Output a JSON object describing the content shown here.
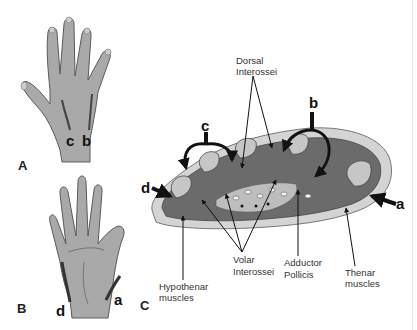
{
  "figure": {
    "panels": [
      {
        "id": "A",
        "label": "A",
        "description": "Dorsal hand with incision sites",
        "site_labels": [
          "c",
          "b"
        ]
      },
      {
        "id": "B",
        "label": "B",
        "description": "Volar hand with incision sites",
        "site_labels": [
          "d",
          "a"
        ]
      },
      {
        "id": "C",
        "label": "C",
        "description": "Cross-section of hand compartments",
        "site_labels": [
          "c",
          "b",
          "d",
          "a"
        ]
      }
    ],
    "panel_a": {
      "letter": "A",
      "site_c": "c",
      "site_b": "b"
    },
    "panel_b": {
      "letter": "B",
      "site_d": "d",
      "site_a": "a"
    },
    "panel_c": {
      "letter": "C",
      "site_b": "b",
      "site_c": "c",
      "site_d": "d",
      "site_a": "a",
      "labels": {
        "dorsal_1": "Dorsal",
        "dorsal_2": "Interossei",
        "volar_1": "Volar",
        "volar_2": "Interossei",
        "adductor_1": "Adductor",
        "adductor_2": "Pollicis",
        "thenar_1": "Thenar",
        "thenar_2": "muscles",
        "hypothenar_1": "Hypothenar",
        "hypothenar_2": "muscles"
      }
    },
    "colors": {
      "skin": "#a9a9a9",
      "skin_outline": "#5a5a5a",
      "muscle": "#6b6b6b",
      "muscle_dark": "#555555",
      "capsule": "#d4d4d4",
      "bone": "#c6c6c6",
      "arrow": "#111111"
    }
  }
}
